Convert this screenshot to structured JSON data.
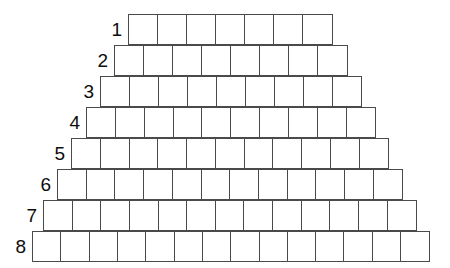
{
  "figure": {
    "shape": "pyramid",
    "background_color": "#ffffff",
    "stroke_color": "#4a4a4a",
    "label_color": "#0d0d0d",
    "row_count": 8,
    "total_cells": 84,
    "rows": [
      {
        "label": "1",
        "cells": 7,
        "left": 128,
        "top": 14,
        "width": 205,
        "height": 31
      },
      {
        "label": "2",
        "cells": 8,
        "left": 114,
        "top": 45,
        "width": 234,
        "height": 31
      },
      {
        "label": "3",
        "cells": 9,
        "left": 100,
        "top": 76,
        "width": 262,
        "height": 31
      },
      {
        "label": "4",
        "cells": 10,
        "left": 86,
        "top": 107,
        "width": 290,
        "height": 31
      },
      {
        "label": "5",
        "cells": 11,
        "left": 71,
        "top": 138,
        "width": 318,
        "height": 31
      },
      {
        "label": "6",
        "cells": 12,
        "left": 57,
        "top": 169,
        "width": 346,
        "height": 31
      },
      {
        "label": "7",
        "cells": 13,
        "left": 43,
        "top": 200,
        "width": 374,
        "height": 31
      },
      {
        "label": "8",
        "cells": 14,
        "left": 32,
        "top": 231,
        "width": 398,
        "height": 31
      }
    ]
  },
  "chart_data": {
    "type": "bar",
    "categories": [
      "1",
      "2",
      "3",
      "4",
      "5",
      "6",
      "7",
      "8"
    ],
    "values": [
      7,
      8,
      9,
      10,
      11,
      12,
      13,
      14
    ],
    "xlabel": "",
    "ylabel": "",
    "ylim": [
      0,
      14
    ],
    "grid": true,
    "legend": "none"
  }
}
